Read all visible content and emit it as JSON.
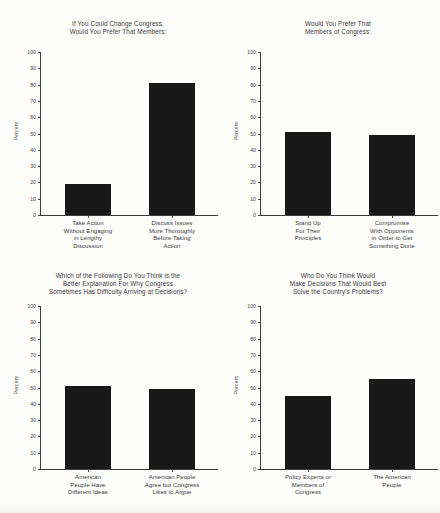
{
  "page": {
    "axis_label": "Percent",
    "y_ticks": [
      0,
      10,
      20,
      30,
      40,
      50,
      60,
      70,
      80,
      90,
      100
    ],
    "y_min": 0,
    "y_max": 100,
    "bar_color": "#181818",
    "axis_color": "#3d3d3d",
    "text_color": "#3a3a3a"
  },
  "chart_data": [
    {
      "type": "bar",
      "title": "If You Could Change Congress,\nWould You Prefer That Members:",
      "categories": [
        "Take Action\nWithout Engaging\nin Lengthy\nDiscussion",
        "Discuss Issues\nMore Thoroughly\nBefore Taking\nAction"
      ],
      "values": [
        19,
        81
      ],
      "xlabel": "",
      "ylabel": "Percent",
      "ylim": [
        0,
        100
      ],
      "yticks": [
        0,
        10,
        20,
        30,
        40,
        50,
        60,
        70,
        80,
        90,
        100
      ],
      "grid": false,
      "legend": "none"
    },
    {
      "type": "bar",
      "title": "Would You Prefer That\nMembers of Congress:",
      "categories": [
        "Stand Up\nFor Their\nPrinciples",
        "Compromise\nWith Opponents\nin Order to Get\nSomething Done"
      ],
      "values": [
        51,
        49
      ],
      "xlabel": "",
      "ylabel": "Percent",
      "ylim": [
        0,
        100
      ],
      "yticks": [
        0,
        10,
        20,
        30,
        40,
        50,
        60,
        70,
        80,
        90,
        100
      ],
      "grid": false,
      "legend": "none"
    },
    {
      "type": "bar",
      "title": "Which of the Following Do You Think is the\nBetter Explanation For Why Congress\nSometimes Has Difficulty Arriving at Decisions?",
      "categories": [
        "American\nPeople Have\nDifferent Ideas",
        "American People\nAgree but Congress\nLikes to Argue"
      ],
      "values": [
        51,
        49
      ],
      "xlabel": "",
      "ylabel": "Percent",
      "ylim": [
        0,
        100
      ],
      "yticks": [
        0,
        10,
        20,
        30,
        40,
        50,
        60,
        70,
        80,
        90,
        100
      ],
      "grid": false,
      "legend": "none"
    },
    {
      "type": "bar",
      "title": "Who Do You Think Would\nMake Decisions That Would Best\nSolve the Country's Problems?",
      "categories": [
        "Policy Experts or\nMembers of\nCongress",
        "The American\nPeople"
      ],
      "values": [
        45,
        55
      ],
      "xlabel": "",
      "ylabel": "Percent",
      "ylim": [
        0,
        100
      ],
      "yticks": [
        0,
        10,
        20,
        30,
        40,
        50,
        60,
        70,
        80,
        90,
        100
      ],
      "grid": false,
      "legend": "none"
    }
  ]
}
